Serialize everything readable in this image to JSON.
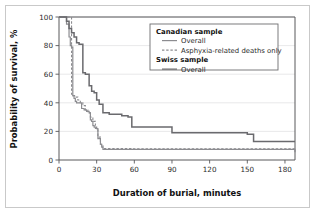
{
  "figure": {
    "frame_color": "#c9c9c9",
    "background": "#ffffff"
  },
  "chart_data": {
    "type": "line",
    "title": "",
    "subtitle": "",
    "xlabel": "Duration of burial, minutes",
    "ylabel": "Probability of survival, %",
    "xlim": [
      0,
      188
    ],
    "ylim": [
      0,
      100
    ],
    "xticks": [
      0,
      30,
      60,
      90,
      120,
      150,
      180
    ],
    "xtick_labels": [
      "0",
      "30",
      "60",
      "90",
      "120",
      "150",
      "180"
    ],
    "yticks": [
      0,
      20,
      40,
      60,
      80,
      100
    ],
    "ytick_labels": [
      "0",
      "20",
      "40",
      "60",
      "80",
      "100"
    ],
    "grid": "horizontal",
    "legend_position": "top-right",
    "step_shape": "post",
    "series": [
      {
        "name": "Canadian sample - Overall",
        "group": "Canadian sample",
        "label": "Overall",
        "style": "solid",
        "color": "#8c8c90",
        "width": 1.2,
        "x": [
          0,
          3,
          6,
          8,
          9,
          10,
          11,
          12,
          13,
          14,
          15,
          18,
          20,
          22,
          24,
          25,
          26,
          27,
          28,
          30,
          31,
          33,
          34,
          35,
          58,
          188
        ],
        "y": [
          100,
          100,
          95,
          86,
          80,
          79,
          45,
          43,
          41,
          40,
          40,
          36,
          35,
          34,
          33,
          28,
          27,
          24,
          23,
          22,
          15,
          11,
          9,
          7.5,
          7.5,
          5.5
        ]
      },
      {
        "name": "Canadian sample - Asphyxia-related deaths only",
        "group": "Canadian sample",
        "label": "Asphyxia-related deaths only",
        "style": "dashed",
        "color": "#8c8c90",
        "width": 1.1,
        "x": [
          0,
          9,
          10,
          11,
          13,
          15,
          17,
          19,
          21,
          23,
          25,
          27,
          29,
          31,
          33,
          35,
          58,
          188
        ],
        "y": [
          100,
          100,
          46,
          45,
          44,
          42,
          40,
          38,
          35,
          33,
          30,
          27,
          22,
          16,
          11,
          8,
          7.8,
          6.2
        ]
      },
      {
        "name": "Swiss sample - Overall",
        "group": "Swiss sample",
        "label": "Overall",
        "style": "solid",
        "color": "#6a6a6e",
        "width": 1.5,
        "x": [
          0,
          4,
          6,
          8,
          10,
          12,
          14,
          16,
          18,
          19,
          21,
          24,
          26,
          28,
          30,
          32,
          35,
          40,
          45,
          50,
          55,
          58,
          88,
          90,
          143,
          150,
          155,
          188
        ],
        "y": [
          100,
          100,
          97,
          92,
          89,
          86,
          82,
          81,
          81,
          61,
          60,
          52,
          48,
          47,
          42,
          39,
          33,
          32,
          32,
          31,
          30,
          23,
          23,
          19,
          19,
          18,
          13,
          13
        ]
      }
    ],
    "legend": [
      {
        "group": "Canadian sample",
        "entries": [
          {
            "label": "Overall",
            "style": "solid",
            "color": "#8c8c90"
          },
          {
            "label": "Asphyxia-related deaths only",
            "style": "dashed",
            "color": "#8c8c90"
          }
        ]
      },
      {
        "group": "Swiss sample",
        "entries": [
          {
            "label": "Overall",
            "style": "solid",
            "color": "#6a6a6e"
          }
        ]
      }
    ]
  }
}
